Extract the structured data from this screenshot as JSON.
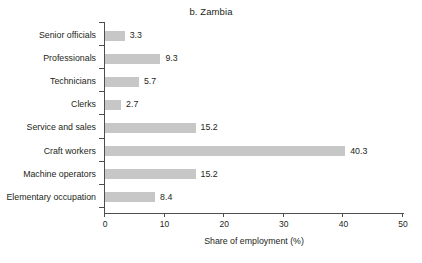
{
  "chart_data": {
    "type": "bar",
    "orientation": "horizontal",
    "title": "b. Zambia",
    "xlabel": "Share of employment (%)",
    "ylabel": "",
    "categories": [
      "Senior officials",
      "Professionals",
      "Technicians",
      "Clerks",
      "Service and sales",
      "Craft workers",
      "Machine operators",
      "Elementary occupation"
    ],
    "values": [
      3.3,
      9.3,
      5.7,
      2.7,
      15.2,
      40.3,
      15.2,
      8.4
    ],
    "value_labels": [
      "3.3",
      "9.3",
      "5.7",
      "2.7",
      "15.2",
      "40.3",
      "15.2",
      "8.4"
    ],
    "xlim": [
      0,
      50
    ],
    "xticks": [
      0,
      10,
      20,
      30,
      40,
      50
    ],
    "xtick_labels": [
      "0",
      "10",
      "20",
      "30",
      "40",
      "50"
    ],
    "grid": false,
    "legend": false,
    "bar_color": "#c7c7c7",
    "axis_color": "#4d4d4d",
    "text_color": "#231f20",
    "background": "#ffffff"
  }
}
